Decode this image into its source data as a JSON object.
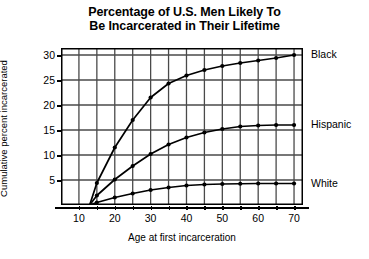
{
  "chart_data": {
    "type": "line",
    "title": "Percentage of U.S. Men Likely To Be Incarcerated in Their Lifetime",
    "title_line1": "Percentage of U.S. Men Likely To",
    "title_line2": "Be Incarcerated in Their Lifetime",
    "xlabel": "Age at first incarceration",
    "ylabel": "Cumulative percent incarcerated",
    "xlim": [
      5,
      72.5
    ],
    "ylim": [
      0,
      31.4
    ],
    "xticks": [
      10,
      20,
      30,
      40,
      50,
      60,
      70
    ],
    "xticklabels": [
      "10",
      "20",
      "30",
      "40",
      "50",
      "60",
      "70"
    ],
    "xminorticks": [
      15,
      25,
      35,
      45,
      55,
      65
    ],
    "yticks": [
      5,
      10,
      15,
      20,
      25,
      30
    ],
    "yticklabels": [
      "5",
      "10",
      "15",
      "20",
      "25",
      "30"
    ],
    "grid": true,
    "legend_position": "right-of-axes-inline",
    "marker": "filled-circle",
    "line_color": "#000000",
    "grid_color": "#4a4a4a",
    "background_color": "#ffffff",
    "series": [
      {
        "name": "Black",
        "label": "Black",
        "label_y_value": 30.0,
        "x": [
          13,
          15,
          20,
          25,
          30,
          35,
          40,
          45,
          50,
          55,
          60,
          65,
          70
        ],
        "values": [
          0,
          4.4,
          11.5,
          17.0,
          21.5,
          24.3,
          25.9,
          27.0,
          27.8,
          28.4,
          28.9,
          29.4,
          30.0
        ]
      },
      {
        "name": "Hispanic",
        "label": "Hispanic",
        "label_y_value": 16.0,
        "x": [
          13,
          15,
          20,
          25,
          30,
          35,
          40,
          45,
          50,
          55,
          60,
          65,
          70
        ],
        "values": [
          0,
          1.9,
          5.1,
          7.8,
          10.2,
          12.1,
          13.5,
          14.5,
          15.2,
          15.7,
          15.9,
          16.0,
          16.0
        ]
      },
      {
        "name": "White",
        "label": "White",
        "label_y_value": 4.3,
        "x": [
          13,
          15,
          20,
          25,
          30,
          35,
          40,
          45,
          50,
          55,
          60,
          65,
          70
        ],
        "values": [
          0,
          0.5,
          1.5,
          2.3,
          3.0,
          3.5,
          3.9,
          4.1,
          4.2,
          4.25,
          4.3,
          4.3,
          4.3
        ]
      }
    ]
  }
}
